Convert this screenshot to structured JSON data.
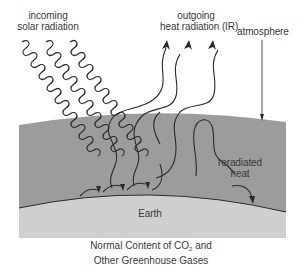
{
  "diagram": {
    "type": "greenhouse-effect-illustration",
    "labels": {
      "incoming_line1": "incoming",
      "incoming_line2": "solar radiation",
      "outgoing_line1": "outgoing",
      "outgoing_line2": "heat radiation (IR)",
      "atmosphere": "atmosphere",
      "reradiated_line1": "reradiated",
      "reradiated_line2": "heat",
      "earth": "Earth"
    },
    "caption": {
      "line1_prefix": "Normal Content of CO",
      "line1_subscript": "2",
      "line1_suffix": " and",
      "line2": "Other Greenhouse Gases"
    },
    "colors": {
      "background": "#ffffff",
      "atmosphere": "#9c9c9c",
      "earth": "#cfcfcf",
      "lines": "#2a2a2a",
      "text": "#3a3a3a"
    },
    "elements": {
      "incoming_solar_waves": 3,
      "outgoing_ir_arrows": 3,
      "reradiated_heat_arrows": 1,
      "absorbed_arrows_at_surface": 3
    }
  }
}
